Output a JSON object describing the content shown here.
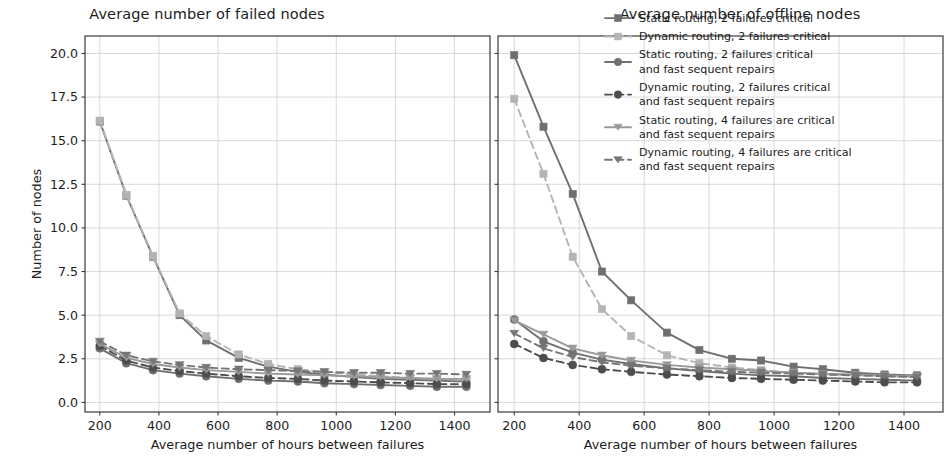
{
  "figure": {
    "background": "#ffffff",
    "ink": "#1c1c1c"
  },
  "chart_data": [
    {
      "type": "line",
      "panel": "left",
      "title": "Average number of failed nodes",
      "xlabel": "Average number of hours between failures",
      "ylabel": "Number of nodes",
      "xlim": [
        150,
        1520
      ],
      "ylim": [
        -0.55,
        21.0
      ],
      "xticks": [
        200,
        400,
        600,
        800,
        1000,
        1200,
        1400
      ],
      "xticklabels": [
        "200",
        "400",
        "600",
        "800",
        "1000",
        "1200",
        "1400"
      ],
      "yticks": [
        0.0,
        2.5,
        5.0,
        7.5,
        10.0,
        12.5,
        15.0,
        17.5,
        20.0
      ],
      "yticklabels": [
        "0.0",
        "2.5",
        "5.0",
        "7.5",
        "10.0",
        "12.5",
        "15.0",
        "17.5",
        "20.0"
      ],
      "grid": true,
      "legend": "none",
      "x": [
        200,
        290,
        380,
        470,
        560,
        670,
        770,
        870,
        960,
        1060,
        1150,
        1250,
        1340,
        1440
      ],
      "series": [
        {
          "name": "Static routing, 2 failures critical",
          "marker": "square",
          "dash": "solid",
          "color": "#6f6f6f",
          "values": [
            16.1,
            11.85,
            8.35,
            5.0,
            3.55,
            2.55,
            2.05,
            1.75,
            1.6,
            1.45,
            1.35,
            1.3,
            1.25,
            1.2
          ]
        },
        {
          "name": "Dynamic routing, 2 failures critical",
          "marker": "square",
          "dash": "dashed",
          "color": "#b4b4b4",
          "values": [
            16.15,
            11.9,
            8.4,
            5.1,
            3.8,
            2.75,
            2.2,
            1.9,
            1.75,
            1.6,
            1.5,
            1.4,
            1.35,
            1.3
          ]
        },
        {
          "name": "Static routing, 2 failures critical and fast sequent repairs",
          "marker": "circle",
          "dash": "solid",
          "color": "#6f6f6f",
          "values": [
            3.1,
            2.25,
            1.85,
            1.65,
            1.5,
            1.35,
            1.25,
            1.2,
            1.1,
            1.05,
            1.0,
            0.95,
            0.9,
            0.9
          ]
        },
        {
          "name": "Dynamic routing, 2 failures critical and fast sequent repairs",
          "marker": "circle",
          "dash": "dashed",
          "color": "#4d4d4d",
          "values": [
            3.25,
            2.4,
            2.0,
            1.8,
            1.65,
            1.5,
            1.4,
            1.35,
            1.25,
            1.2,
            1.15,
            1.1,
            1.05,
            1.05
          ]
        },
        {
          "name": "Static routing, 4 failures are critical and fast sequent repairs",
          "marker": "triangle-down",
          "dash": "solid",
          "color": "#9a9a9a",
          "values": [
            3.35,
            2.55,
            2.2,
            2.0,
            1.85,
            1.75,
            1.65,
            1.6,
            1.55,
            1.5,
            1.45,
            1.4,
            1.35,
            1.35
          ]
        },
        {
          "name": "Dynamic routing, 4 failures are critical and fast sequent repairs",
          "marker": "triangle-down",
          "dash": "dashed",
          "color": "#767676",
          "values": [
            3.5,
            2.7,
            2.35,
            2.15,
            2.0,
            1.9,
            1.85,
            1.8,
            1.75,
            1.7,
            1.7,
            1.65,
            1.65,
            1.6
          ]
        }
      ]
    },
    {
      "type": "line",
      "panel": "right",
      "title": "Average number of offline nodes",
      "xlabel": "Average number of hours between failures",
      "ylabel": "",
      "xlim": [
        150,
        1520
      ],
      "ylim": [
        -0.55,
        21.0
      ],
      "xticks": [
        200,
        400,
        600,
        800,
        1000,
        1200,
        1400
      ],
      "xticklabels": [
        "200",
        "400",
        "600",
        "800",
        "1000",
        "1200",
        "1400"
      ],
      "yticks": [
        0.0,
        2.5,
        5.0,
        7.5,
        10.0,
        12.5,
        15.0,
        17.5,
        20.0
      ],
      "yticklabels": [
        "",
        "",
        "",
        "",
        "",
        "",
        "",
        "",
        ""
      ],
      "grid": true,
      "legend": "upper right",
      "x": [
        200,
        290,
        380,
        470,
        560,
        670,
        770,
        870,
        960,
        1060,
        1150,
        1250,
        1340,
        1440
      ],
      "series": [
        {
          "name": "Static routing, 2 failures critical",
          "marker": "square",
          "dash": "solid",
          "color": "#6f6f6f",
          "values": [
            19.9,
            15.8,
            11.95,
            7.5,
            5.85,
            4.0,
            3.0,
            2.5,
            2.4,
            2.05,
            1.9,
            1.7,
            1.6,
            1.55
          ]
        },
        {
          "name": "Dynamic routing, 2 failures critical",
          "marker": "square",
          "dash": "dashed",
          "color": "#b4b4b4",
          "values": [
            17.4,
            13.1,
            8.35,
            5.35,
            3.8,
            2.7,
            2.25,
            2.0,
            1.85,
            1.7,
            1.6,
            1.55,
            1.5,
            1.45
          ]
        },
        {
          "name": "Static routing, 2 failures critical and fast sequent repairs",
          "marker": "circle",
          "dash": "solid",
          "color": "#6f6f6f",
          "values": [
            4.75,
            3.5,
            2.85,
            2.45,
            2.2,
            1.95,
            1.8,
            1.65,
            1.55,
            1.5,
            1.4,
            1.35,
            1.3,
            1.25
          ]
        },
        {
          "name": "Dynamic routing, 2 failures critical and fast sequent repairs",
          "marker": "circle",
          "dash": "dashed",
          "color": "#4d4d4d",
          "values": [
            3.35,
            2.55,
            2.15,
            1.9,
            1.75,
            1.6,
            1.5,
            1.4,
            1.35,
            1.3,
            1.25,
            1.2,
            1.15,
            1.15
          ]
        },
        {
          "name": "Static routing, 4 failures are critical and fast sequent repairs",
          "marker": "triangle-down",
          "dash": "solid",
          "color": "#9a9a9a",
          "values": [
            4.7,
            3.9,
            3.1,
            2.7,
            2.4,
            2.15,
            2.0,
            1.9,
            1.8,
            1.7,
            1.65,
            1.6,
            1.55,
            1.5
          ]
        },
        {
          "name": "Dynamic routing, 4 failures are critical and fast sequent repairs",
          "marker": "triangle-down",
          "dash": "dashed",
          "color": "#767676",
          "values": [
            3.95,
            3.1,
            2.6,
            2.3,
            2.1,
            1.95,
            1.85,
            1.75,
            1.7,
            1.65,
            1.6,
            1.55,
            1.5,
            1.45
          ]
        }
      ],
      "legend_entries": [
        {
          "label_lines": [
            "Static routing, 2 failures critical"
          ],
          "marker": "square",
          "dash": "solid",
          "color": "#6f6f6f"
        },
        {
          "label_lines": [
            "Dynamic routing, 2 failures critical"
          ],
          "marker": "square",
          "dash": "dashed",
          "color": "#b4b4b4"
        },
        {
          "label_lines": [
            "Static routing, 2 failures critical",
            "and fast sequent repairs"
          ],
          "marker": "circle",
          "dash": "solid",
          "color": "#6f6f6f"
        },
        {
          "label_lines": [
            "Dynamic routing, 2 failures critical",
            "and fast sequent repairs"
          ],
          "marker": "circle",
          "dash": "dashed",
          "color": "#4d4d4d"
        },
        {
          "label_lines": [
            "Static routing, 4 failures are critical",
            "and fast sequent repairs"
          ],
          "marker": "triangle-down",
          "dash": "solid",
          "color": "#9a9a9a"
        },
        {
          "label_lines": [
            "Dynamic routing, 4 failures are critical",
            "and fast sequent repairs"
          ],
          "marker": "triangle-down",
          "dash": "dashed",
          "color": "#767676"
        }
      ]
    }
  ]
}
